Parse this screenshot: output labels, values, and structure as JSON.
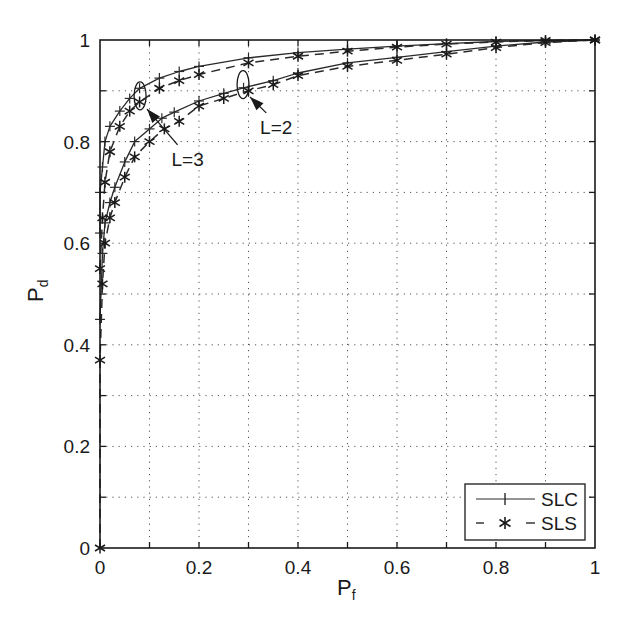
{
  "chart_data": {
    "type": "line",
    "title": "",
    "xlabel": "P_f",
    "ylabel": "P_d",
    "xlabel_main": "P",
    "xlabel_sub": "f",
    "ylabel_main": "P",
    "ylabel_sub": "d",
    "xlim": [
      0,
      1
    ],
    "ylim": [
      0,
      1
    ],
    "grid": true,
    "grid_style": "dotted",
    "grid_step": 0.1,
    "x_ticks": [
      0,
      0.2,
      0.4,
      0.6,
      0.8,
      1
    ],
    "x_tick_labels": [
      "0",
      "0.2",
      "0.4",
      "0.6",
      "0.8",
      "1"
    ],
    "y_ticks": [
      0,
      0.2,
      0.4,
      0.6,
      0.8,
      1
    ],
    "y_tick_labels": [
      "0",
      "0.2",
      "0.4",
      "0.6",
      "0.8",
      "1"
    ],
    "legend": {
      "position": "lower right",
      "entries": [
        {
          "label": "SLC",
          "line": "solid",
          "marker": "+"
        },
        {
          "label": "SLS",
          "line": "dashed",
          "marker": "*"
        }
      ]
    },
    "annotations": [
      {
        "text": "L=3",
        "ellipse_at": [
          0.081,
          0.89
        ],
        "label_at": [
          0.177,
          0.766
        ],
        "arrow_tip": [
          0.095,
          0.864
        ]
      },
      {
        "text": "L=2",
        "ellipse_at": [
          0.289,
          0.912
        ],
        "label_at": [
          0.356,
          0.829
        ],
        "arrow_tip": [
          0.303,
          0.888
        ]
      }
    ],
    "series": [
      {
        "name": "SLC L=3",
        "group": "SLC",
        "L": 3,
        "style": "solid",
        "marker": "+",
        "x": [
          0,
          0,
          0.005,
          0.01,
          0.02,
          0.04,
          0.06,
          0.08,
          0.12,
          0.16,
          0.2,
          0.3,
          0.4,
          0.5,
          0.6,
          0.7,
          0.8,
          0.9,
          1
        ],
        "y": [
          0.62,
          0.7,
          0.75,
          0.8,
          0.83,
          0.86,
          0.885,
          0.905,
          0.925,
          0.938,
          0.948,
          0.965,
          0.975,
          0.982,
          0.988,
          0.993,
          0.997,
          0.999,
          1
        ]
      },
      {
        "name": "SLS L=3",
        "group": "SLS",
        "L": 3,
        "style": "dashed",
        "marker": "*",
        "x": [
          0,
          0.005,
          0.01,
          0.02,
          0.04,
          0.06,
          0.08,
          0.12,
          0.16,
          0.2,
          0.3,
          0.4,
          0.5,
          0.6,
          0.7,
          0.8,
          0.9,
          1
        ],
        "y": [
          0.55,
          0.65,
          0.72,
          0.78,
          0.83,
          0.86,
          0.878,
          0.905,
          0.92,
          0.932,
          0.955,
          0.968,
          0.978,
          0.986,
          0.992,
          0.996,
          0.999,
          1
        ]
      },
      {
        "name": "SLC L=2",
        "group": "SLC",
        "L": 2,
        "style": "solid",
        "marker": "+",
        "x": [
          0,
          0.005,
          0.01,
          0.02,
          0.03,
          0.05,
          0.07,
          0.1,
          0.125,
          0.15,
          0.2,
          0.25,
          0.29,
          0.35,
          0.4,
          0.5,
          0.6,
          0.7,
          0.8,
          0.9,
          1
        ],
        "y": [
          0.45,
          0.58,
          0.64,
          0.68,
          0.71,
          0.76,
          0.8,
          0.825,
          0.846,
          0.858,
          0.88,
          0.895,
          0.906,
          0.92,
          0.935,
          0.955,
          0.966,
          0.977,
          0.988,
          0.996,
          1
        ]
      },
      {
        "name": "SLS L=2",
        "group": "SLS",
        "L": 2,
        "style": "dashed",
        "marker": "*",
        "x": [
          0,
          0,
          0.005,
          0.01,
          0.02,
          0.03,
          0.05,
          0.07,
          0.1,
          0.13,
          0.16,
          0.2,
          0.25,
          0.3,
          0.35,
          0.4,
          0.5,
          0.6,
          0.7,
          0.8,
          0.9,
          1
        ],
        "y": [
          0,
          0.37,
          0.52,
          0.6,
          0.65,
          0.68,
          0.73,
          0.77,
          0.8,
          0.825,
          0.84,
          0.87,
          0.885,
          0.9,
          0.912,
          0.93,
          0.948,
          0.96,
          0.972,
          0.985,
          0.995,
          1
        ]
      }
    ]
  },
  "colors": {
    "axis": "#1a1a1a",
    "curve": "#2a2a2a",
    "grid": "#555555",
    "background": "#ffffff"
  }
}
